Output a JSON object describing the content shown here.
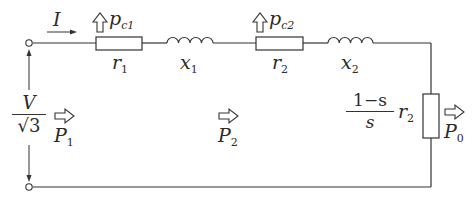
{
  "diagram": {
    "wire_color": "#333333",
    "components": [
      {
        "id": "r1",
        "type": "resistor",
        "label": "r",
        "sub": "1",
        "loss_label": "p",
        "loss_sub": "c1"
      },
      {
        "id": "x1",
        "type": "inductor",
        "label": "x",
        "sub": "1"
      },
      {
        "id": "r2",
        "type": "resistor",
        "label": "r",
        "sub": "2",
        "loss_label": "p",
        "loss_sub": "c2"
      },
      {
        "id": "x2",
        "type": "inductor",
        "label": "x",
        "sub": "2"
      },
      {
        "id": "load",
        "type": "resistor",
        "orientation": "vertical",
        "label_num": "1−s",
        "label_den": "s",
        "label_factor": "r",
        "label_factor_sub": "2"
      }
    ],
    "current": {
      "label": "I"
    },
    "voltage": {
      "num": "V",
      "den": "√3"
    },
    "power_flows": [
      {
        "label": "P",
        "sub": "1"
      },
      {
        "label": "P",
        "sub": "2"
      },
      {
        "label": "P",
        "sub": "0"
      }
    ]
  }
}
